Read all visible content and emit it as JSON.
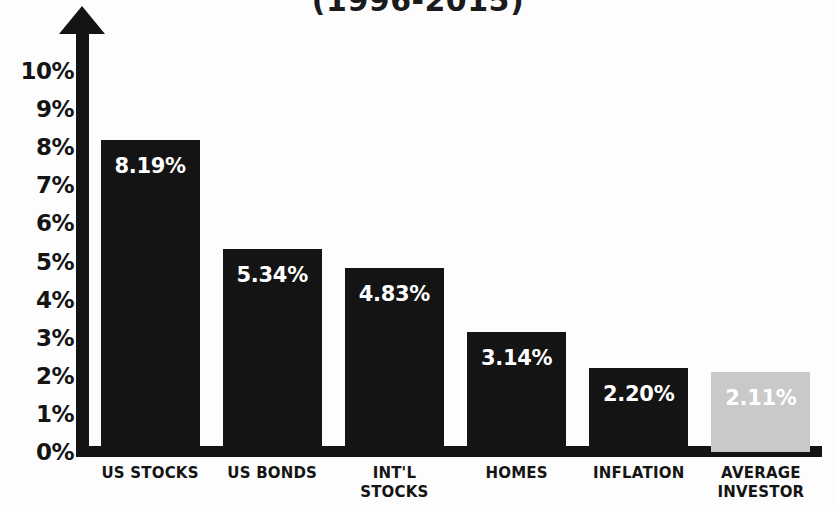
{
  "chart_data": {
    "type": "bar",
    "title": "(1996-2015)",
    "xlabel": "",
    "ylabel": "",
    "ylim": [
      0,
      10
    ],
    "grid": false,
    "legend": null,
    "y_ticks": [
      "10%",
      "9%",
      "8%",
      "7%",
      "6%",
      "5%",
      "4%",
      "3%",
      "2%",
      "1%",
      "0%"
    ],
    "y_tick_values": [
      10,
      9,
      8,
      7,
      6,
      5,
      4,
      3,
      2,
      1,
      0
    ],
    "categories": [
      "US STOCKS",
      "US BONDS",
      "INT'L STOCKS",
      "HOMES",
      "INFLATION",
      "AVERAGE INVESTOR"
    ],
    "category_lines": [
      [
        "US STOCKS"
      ],
      [
        "US BONDS"
      ],
      [
        "INT'L",
        "STOCKS"
      ],
      [
        "HOMES"
      ],
      [
        "INFLATION"
      ],
      [
        "AVERAGE",
        "INVESTOR"
      ]
    ],
    "values": [
      8.19,
      5.34,
      4.83,
      3.14,
      2.2,
      2.11
    ],
    "value_labels": [
      "8.19%",
      "5.34%",
      "4.83%",
      "3.14%",
      "2.20%",
      "2.11%"
    ],
    "bar_colors": [
      "#141414",
      "#141414",
      "#141414",
      "#141414",
      "#141414",
      "#c9c9c9"
    ],
    "value_label_color": "#ffffff",
    "axis_color": "#141414",
    "background_color": "#fdfdfd"
  }
}
